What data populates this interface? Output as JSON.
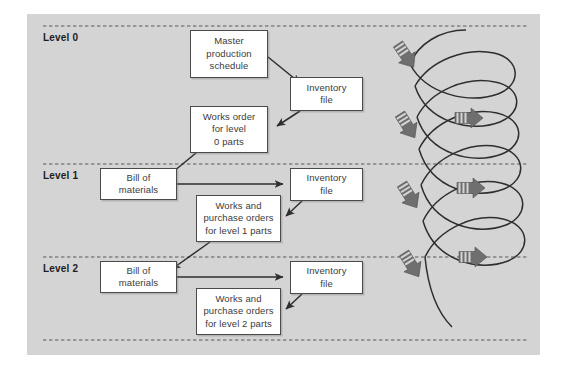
{
  "diagram": {
    "panel_color": "#d4d4d4",
    "box_fill": "#ffffff",
    "box_border": "#4a4a4a",
    "arrow_color": "#6f6f6f",
    "connector_color": "#2e2e2e",
    "level_bands": [
      {
        "id": "level-0",
        "label": "Level 0"
      },
      {
        "id": "level-1",
        "label": "Level 1"
      },
      {
        "id": "level-2",
        "label": "Level 2"
      }
    ],
    "nodes": [
      {
        "id": "master-production-schedule",
        "label": "Master\nproduction\nschedule",
        "level": "Level 0"
      },
      {
        "id": "inventory-file-level-0",
        "label": "Inventory\nfile",
        "level": "Level 0"
      },
      {
        "id": "works-order-level-0",
        "label": "Works order\nfor level\n0 parts",
        "level": "Level 0"
      },
      {
        "id": "bill-of-materials-level-1",
        "label": "Bill of\nmaterials",
        "level": "Level 1"
      },
      {
        "id": "inventory-file-level-1",
        "label": "Inventory\nfile",
        "level": "Level 1"
      },
      {
        "id": "works-orders-level-1",
        "label": "Works and\npurchase orders\nfor level 1 parts",
        "level": "Level 1"
      },
      {
        "id": "bill-of-materials-level-2",
        "label": "Bill of\nmaterials",
        "level": "Level 2"
      },
      {
        "id": "inventory-file-level-2",
        "label": "Inventory\nfile",
        "level": "Level 2"
      },
      {
        "id": "works-orders-level-2",
        "label": "Works and\npurchase orders\nfor level 2 parts",
        "level": "Level 2"
      }
    ],
    "connectors": [
      {
        "from": "master-production-schedule",
        "to": "inventory-file-level-0"
      },
      {
        "from": "inventory-file-level-0",
        "to": "works-order-level-0"
      },
      {
        "from": "works-order-level-0",
        "to": "bill-of-materials-level-1"
      },
      {
        "from": "bill-of-materials-level-1",
        "to": "inventory-file-level-1"
      },
      {
        "from": "inventory-file-level-1",
        "to": "works-orders-level-1"
      },
      {
        "from": "works-orders-level-1",
        "to": "bill-of-materials-level-2"
      },
      {
        "from": "bill-of-materials-level-2",
        "to": "inventory-file-level-2"
      },
      {
        "from": "inventory-file-level-2",
        "to": "works-orders-level-2"
      }
    ],
    "side_graphic": {
      "name": "descending-spiral-arrows",
      "description": "Spiral loop threaded with downward-left and rightward fletched arrows indicating iterative explosion down the levels",
      "loop_count": 4,
      "down_arrow_count": 4,
      "right_arrow_count": 3
    }
  }
}
